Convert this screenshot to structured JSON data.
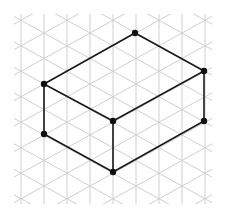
{
  "figure": {
    "width": 225,
    "height": 210
  },
  "grid": {
    "type": "isometric",
    "line_color": "#cfcfcf",
    "line_width": 1,
    "col_spacing": 23,
    "row_spacing": 25.5,
    "origin_x": 44,
    "origin_y": 84,
    "clip": {
      "x": 14,
      "y": 14,
      "width": 198,
      "height": 190
    }
  },
  "shape": {
    "name": "rectangular-prism",
    "edge_color": "#1a1a1a",
    "edge_width": 1.6,
    "vertex_color": "#111111",
    "vertex_radius": 3.2,
    "vertices": {
      "top_back": [
        135,
        33
      ],
      "top_left": [
        44,
        84
      ],
      "top_right": [
        204,
        71
      ],
      "top_front": [
        113,
        121
      ],
      "bottom_left": [
        44,
        134
      ],
      "bottom_front": [
        113,
        172
      ],
      "bottom_right": [
        204,
        121
      ]
    },
    "edges": [
      [
        "top_left",
        "top_back"
      ],
      [
        "top_back",
        "top_right"
      ],
      [
        "top_right",
        "top_front"
      ],
      [
        "top_front",
        "top_left"
      ],
      [
        "top_left",
        "bottom_left"
      ],
      [
        "top_front",
        "bottom_front"
      ],
      [
        "top_right",
        "bottom_right"
      ],
      [
        "bottom_left",
        "bottom_front"
      ],
      [
        "bottom_front",
        "bottom_right"
      ]
    ],
    "dimensions_in_grid_units": {
      "length": 4,
      "width": 3,
      "height": 2
    }
  }
}
